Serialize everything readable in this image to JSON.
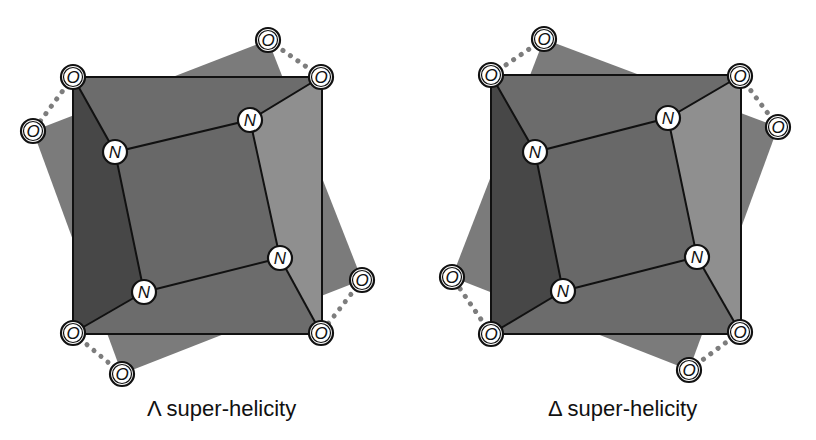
{
  "colors": {
    "back_square": "#7b7b7b",
    "front_square": "#6c6c6c",
    "dark_face": "#474747",
    "light_face": "#8f8f8f",
    "bond": "#111111",
    "hbond": "#7d7d7d"
  },
  "atoms": {
    "oxygen_label": "O",
    "nitrogen_label": "N"
  },
  "panels": [
    {
      "id": "lambda",
      "caption": "Λ super-helicity",
      "front_O": [
        [
          73,
          77
        ],
        [
          321,
          77
        ],
        [
          321,
          333
        ],
        [
          73,
          333
        ]
      ],
      "back_O": [
        [
          33,
          131
        ],
        [
          268,
          40
        ],
        [
          362,
          280
        ],
        [
          122,
          374
        ]
      ],
      "N": [
        [
          115,
          152
        ],
        [
          250,
          120
        ],
        [
          280,
          258
        ],
        [
          144,
          292
        ]
      ]
    },
    {
      "id": "delta",
      "caption": "Δ super-helicity",
      "front_O": [
        [
          491,
          75
        ],
        [
          740,
          76
        ],
        [
          740,
          332
        ],
        [
          491,
          334
        ]
      ],
      "back_O": [
        [
          544,
          39
        ],
        [
          778,
          127
        ],
        [
          689,
          370
        ],
        [
          452,
          277
        ]
      ],
      "N": [
        [
          535,
          152
        ],
        [
          668,
          118
        ],
        [
          697,
          257
        ],
        [
          563,
          291
        ]
      ]
    }
  ]
}
